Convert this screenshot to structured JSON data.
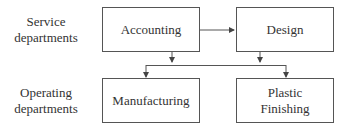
{
  "diagram": {
    "rows": [
      {
        "label_line1": "Service",
        "label_line2": "departments"
      },
      {
        "label_line1": "Operating",
        "label_line2": "departments"
      }
    ],
    "nodes": {
      "accounting": {
        "label": "Accounting"
      },
      "design": {
        "label": "Design"
      },
      "manufacturing": {
        "label": "Manufacturing"
      },
      "plastic_finishing": {
        "label_line1": "Plastic",
        "label_line2": "Finishing"
      }
    },
    "edges": [
      {
        "from": "Accounting",
        "to": "Design"
      },
      {
        "from": "Accounting",
        "to": "Manufacturing"
      },
      {
        "from": "Accounting",
        "to": "Plastic Finishing"
      },
      {
        "from": "Design",
        "to": "Manufacturing"
      },
      {
        "from": "Design",
        "to": "Plastic Finishing"
      }
    ],
    "colors": {
      "line": "#555555",
      "text": "#333333",
      "background": "#ffffff"
    }
  }
}
